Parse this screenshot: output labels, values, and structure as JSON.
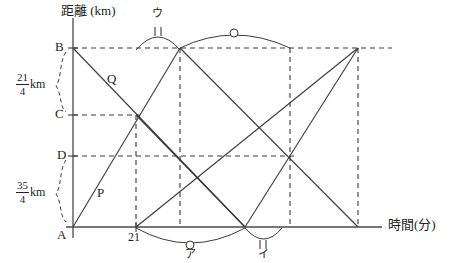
{
  "figure": {
    "type": "geometry-line-graph",
    "axes": {
      "y_label": "距離 (km)",
      "x_label": "時間(分)",
      "origin_label": "A"
    },
    "axis_points": [
      {
        "name": "B",
        "label": "B",
        "x": 73,
        "y": 48
      },
      {
        "name": "C",
        "label": "C",
        "x": 73,
        "y": 115
      },
      {
        "name": "D",
        "label": "D",
        "x": 73,
        "y": 156
      },
      {
        "name": "A",
        "label": "A",
        "x": 73,
        "y": 227
      }
    ],
    "brace_labels": [
      {
        "name": "B-to-C",
        "numerator": "21",
        "denominator": "4",
        "unit": "km"
      },
      {
        "name": "D-to-A",
        "numerator": "35",
        "denominator": "4",
        "unit": "km"
      }
    ],
    "line_labels": [
      {
        "name": "P",
        "label": "P",
        "x": 100,
        "y": 192
      },
      {
        "name": "Q",
        "label": "Q",
        "x": 110,
        "y": 78
      }
    ],
    "tick_labels": [
      {
        "name": "x-tick-21",
        "label": "21",
        "x": 128,
        "y": 231
      }
    ],
    "arc_labels": [
      {
        "name": "arc-a",
        "label": "ア",
        "marker": "circle",
        "x": 190,
        "y": 245
      },
      {
        "name": "arc-i",
        "label": "イ",
        "marker": "double-tick",
        "x": 264,
        "y": 245
      },
      {
        "name": "arc-u",
        "label": "ウ",
        "marker": "double-tick",
        "x": 155,
        "y": 14
      },
      {
        "name": "arc-unlabeled",
        "label": "",
        "marker": "circle",
        "x": 233,
        "y": 32
      }
    ],
    "colors": {
      "stroke": "#3a3a3a",
      "axis": "#4a4a4a",
      "text": "#231f20"
    }
  }
}
